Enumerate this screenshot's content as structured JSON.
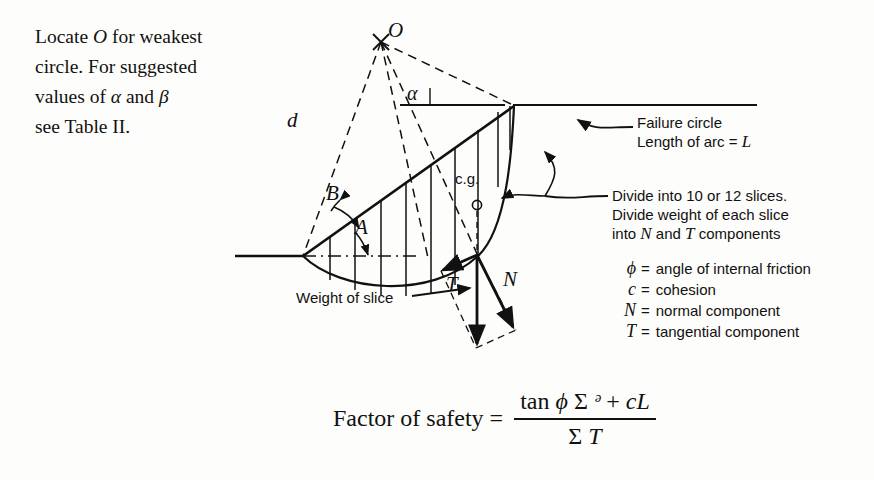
{
  "intro": {
    "line1_a": "Locate ",
    "line1_sym": "O",
    "line1_b": " for weakest",
    "line2": "circle.   For suggested",
    "line3_a": "values of ",
    "line3_alpha": "α",
    "line3_b": " and ",
    "line3_beta": "β",
    "line4": "see Table II."
  },
  "annotations": {
    "failure_circle": "Failure circle",
    "arc_length_pre": "Length of arc = ",
    "arc_length_sym": "L",
    "divide_line1": "Divide into 10 or 12 slices.",
    "divide_line2": "Divide weight of each slice",
    "divide_line3_pre": "into ",
    "divide_line3_n": "N",
    "divide_line3_mid": " and ",
    "divide_line3_t": "T",
    "divide_line3_post": " components",
    "weight_of_slice": "Weight of slice"
  },
  "legend": [
    {
      "symbol": "ϕ",
      "eq": "=",
      "text": "angle of internal friction"
    },
    {
      "symbol": "c",
      "eq": "=",
      "text": "cohesion"
    },
    {
      "symbol": "N",
      "eq": "=",
      "text": "normal component"
    },
    {
      "symbol": "T",
      "eq": "=",
      "text": "tangential component"
    }
  ],
  "diagram_labels": {
    "center_point": "O",
    "radius_d": "d",
    "angle_alpha": "α",
    "angle_B": "B",
    "angle_A": "A",
    "force_T": "T",
    "force_N": "N",
    "center_of_gravity": "c.g."
  },
  "formula": {
    "lead": "Factor of safety  =",
    "numerator_tan": "tan ",
    "numerator_phi": "ϕ",
    "numerator_sigma1": " Σ ",
    "numerator_N": "ᵊ",
    "numerator_plus": " + ",
    "numerator_c": "c",
    "numerator_L": "L",
    "denominator_sigma": "Σ ",
    "denominator_T": "T"
  },
  "colors": {
    "ink": "#111111",
    "paper": "#fdfdfb"
  }
}
